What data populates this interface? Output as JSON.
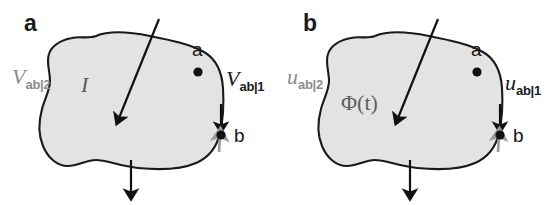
{
  "figure": {
    "type": "two-panel-schematic",
    "background": "#ffffff",
    "width": 559,
    "height": 205
  },
  "colors": {
    "blob_fill": "#e3e3e3",
    "blob_stroke": "#1a1a1a",
    "arrow_black": "#111111",
    "arrow_gray": "#9a9a9a",
    "label_gray": "#8d8d8d",
    "label_black": "#1a1a1a",
    "flux_gray": "#5f5f5f"
  },
  "panels": [
    {
      "id": "a",
      "letter": "a",
      "region_label": {
        "text": "I",
        "name": "current-label",
        "description": "current through the region"
      },
      "left_label": {
        "base": "V",
        "sub": "ab|2",
        "color": "gray"
      },
      "right_label": {
        "base": "V",
        "sub": "ab|1",
        "color": "black"
      },
      "point_a": "a",
      "point_b": "b"
    },
    {
      "id": "b",
      "letter": "b",
      "region_label": {
        "text": "Φ(t)",
        "name": "flux-label",
        "description": "magnetic flux as a function of time"
      },
      "left_label": {
        "base": "u",
        "sub": "ab|2",
        "color": "gray"
      },
      "right_label": {
        "base": "u",
        "sub": "ab|1",
        "color": "black"
      },
      "point_a": "a",
      "point_b": "b"
    }
  ],
  "arrows": {
    "diagonal_in": "diagonal arrow entering from upper right, crossing top boundary, pointing down-left into the region",
    "bottom_out": "vertical arrow crossing the bottom boundary pointing downward out of the region",
    "boundary_down": "black arrowhead on the right boundary pointing down toward point b",
    "boundary_up_gray": "gray arrow below point b pointing up toward point b"
  }
}
